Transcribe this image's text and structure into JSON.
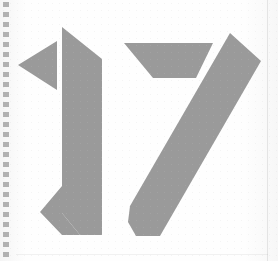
{
  "page": {
    "kind": "scanned-page",
    "width": 278,
    "height": 261,
    "background_color": "#fefefe",
    "ink_color": "#9a9a9a",
    "ink_render": "halftone-dither",
    "page_number_text": "17",
    "caption": "17"
  },
  "binding": {
    "name": "spiral-binding-perforation",
    "side": "left",
    "dot_color": "#9e9e9e",
    "dot_count": 26,
    "dot_spacing_px": 10,
    "dot_width_px": 6,
    "dot_height_px": 5,
    "start_y_px": 2
  },
  "edges": {
    "right_edge_color": "#bdbdbd",
    "bottom_edge_color": "#d0d0d0"
  },
  "artwork": {
    "name": "large-numeral-17",
    "description": "Large stylized numeral 17 rendered as flat angular ink shapes",
    "glyphs": [
      {
        "character": "1",
        "name": "numeral-one",
        "parts": [
          {
            "name": "one-flag-triangle",
            "shape": "triangle",
            "points": "18,65 57,41 57,90"
          },
          {
            "name": "one-stem",
            "shape": "polygon",
            "points": "62,27 102,59 102,235 80,235 62,213"
          },
          {
            "name": "one-foot",
            "shape": "polygon",
            "points": "62,213 62,186 40,212 62,235 80,235"
          }
        ]
      },
      {
        "character": "7",
        "name": "numeral-seven",
        "parts": [
          {
            "name": "seven-crossbar",
            "shape": "trapezoid",
            "points": "124,43 213,43 196,78 153,78"
          },
          {
            "name": "seven-diagonal",
            "shape": "polygon",
            "points": "230,33 261,61 160,236 136,236 130,206"
          },
          {
            "name": "seven-diagonal-foot",
            "shape": "polygon",
            "points": "130,206 155,213 136,236 128,222"
          }
        ]
      }
    ]
  }
}
